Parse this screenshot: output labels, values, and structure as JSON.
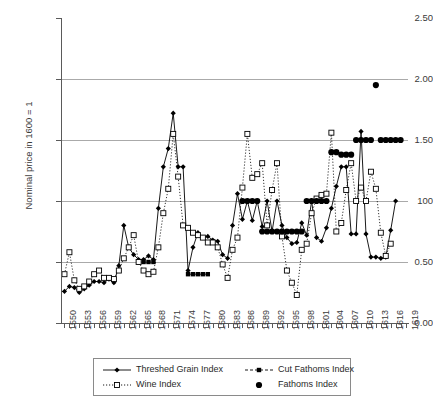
{
  "chart_data": {
    "type": "line",
    "title": "",
    "xlabel": "",
    "ylabel": "Nominal price in 1600 = 1",
    "ylim": [
      0.0,
      2.5
    ],
    "ytick_labels": [
      "0.00",
      "0.50",
      "100",
      "1.50",
      "2.00",
      "2.50"
    ],
    "ytick_values": [
      0.0,
      0.5,
      1.0,
      1.5,
      2.0,
      2.5
    ],
    "grid": "horizontal",
    "legend_position": "bottom",
    "x_start": 1550,
    "x_end": 1619,
    "xtick_labels": [
      "1550",
      "1553",
      "1556",
      "1559",
      "1562",
      "1565",
      "1568",
      "1571",
      "1574",
      "1577",
      "1580",
      "1583",
      "1586",
      "1589",
      "1592",
      "1595",
      "1598",
      "1601",
      "1604",
      "1607",
      "1610",
      "1613",
      "1616",
      "1619"
    ],
    "x": [
      1550,
      1551,
      1552,
      1553,
      1554,
      1555,
      1556,
      1557,
      1558,
      1559,
      1560,
      1561,
      1562,
      1563,
      1564,
      1565,
      1566,
      1567,
      1568,
      1569,
      1570,
      1571,
      1572,
      1573,
      1574,
      1575,
      1576,
      1577,
      1578,
      1579,
      1580,
      1581,
      1582,
      1583,
      1584,
      1585,
      1586,
      1587,
      1588,
      1589,
      1590,
      1591,
      1592,
      1593,
      1594,
      1595,
      1596,
      1597,
      1598,
      1599,
      1600,
      1601,
      1602,
      1603,
      1604,
      1605,
      1606,
      1607,
      1608,
      1609,
      1610,
      1611,
      1612,
      1613,
      1614,
      1615,
      1616,
      1617,
      1618,
      1619
    ],
    "series": [
      {
        "name": "Threshed Grain Index",
        "marker": "filled-diamond",
        "line": "solid",
        "color": "#000000",
        "values": [
          0.26,
          0.3,
          0.29,
          0.25,
          0.28,
          0.31,
          0.34,
          0.34,
          0.33,
          0.36,
          0.33,
          0.47,
          0.8,
          0.62,
          0.56,
          0.52,
          0.52,
          0.55,
          0.52,
          0.94,
          1.28,
          1.43,
          1.72,
          1.28,
          1.28,
          0.43,
          0.62,
          0.74,
          0.7,
          0.71,
          0.68,
          0.67,
          0.56,
          0.53,
          0.8,
          1.06,
          0.85,
          1.0,
          0.84,
          1.0,
          0.79,
          1.0,
          0.75,
          1.0,
          0.8,
          0.7,
          0.65,
          0.66,
          0.82,
          0.72,
          1.0,
          0.7,
          0.67,
          0.78,
          0.94,
          1.12,
          1.28,
          1.28,
          0.73,
          0.73,
          1.57,
          0.73,
          0.54,
          0.54,
          0.53,
          0.54,
          0.76,
          1.0,
          null,
          null
        ]
      },
      {
        "name": "Cut Fathoms Index",
        "marker": "filled-square",
        "line": "dashed",
        "color": "#000000",
        "values": [
          null,
          null,
          null,
          null,
          null,
          null,
          null,
          null,
          null,
          null,
          null,
          null,
          null,
          null,
          null,
          0.5,
          0.5,
          0.5,
          0.5,
          null,
          null,
          null,
          null,
          null,
          null,
          0.4,
          0.4,
          0.4,
          0.4,
          0.4,
          null,
          null,
          null,
          null,
          null,
          null,
          null,
          null,
          null,
          null,
          null,
          null,
          null,
          null,
          null,
          null,
          null,
          null,
          null,
          null,
          null,
          null,
          null,
          null,
          null,
          null,
          null,
          null,
          null,
          null,
          null,
          null,
          null,
          null,
          null,
          null,
          null,
          null,
          null,
          null
        ]
      },
      {
        "name": "Wine Index",
        "marker": "open-square",
        "line": "dotted",
        "color": "#000000",
        "values": [
          0.4,
          0.58,
          0.35,
          0.28,
          0.3,
          0.34,
          0.4,
          0.43,
          0.37,
          0.37,
          0.36,
          0.43,
          0.53,
          0.62,
          0.72,
          0.5,
          0.43,
          0.4,
          0.42,
          0.62,
          0.9,
          1.1,
          1.55,
          1.2,
          0.8,
          0.78,
          0.74,
          0.72,
          0.7,
          0.66,
          0.66,
          0.62,
          0.48,
          0.37,
          0.6,
          0.7,
          1.11,
          1.55,
          1.19,
          1.22,
          1.31,
          0.8,
          1.09,
          1.31,
          0.71,
          0.43,
          0.33,
          0.23,
          0.6,
          0.65,
          0.9,
          1.02,
          1.05,
          1.06,
          1.56,
          0.75,
          0.82,
          1.09,
          1.31,
          1.0,
          1.11,
          1.0,
          1.24,
          1.1,
          0.74,
          0.55,
          0.65,
          null,
          null,
          null
        ]
      },
      {
        "name": "Fathoms Index",
        "marker": "filled-circle",
        "line": "none",
        "color": "#000000",
        "values": [
          null,
          null,
          null,
          null,
          null,
          null,
          null,
          null,
          null,
          null,
          null,
          null,
          null,
          null,
          null,
          null,
          null,
          null,
          null,
          null,
          null,
          null,
          null,
          null,
          null,
          null,
          null,
          null,
          null,
          null,
          null,
          null,
          null,
          null,
          null,
          null,
          1.0,
          1.0,
          1.0,
          1.0,
          0.75,
          0.75,
          0.75,
          0.75,
          0.75,
          0.75,
          0.75,
          0.75,
          0.75,
          1.0,
          1.0,
          1.0,
          1.0,
          1.0,
          1.4,
          1.4,
          1.38,
          1.38,
          1.38,
          1.5,
          1.5,
          1.5,
          1.5,
          1.95,
          1.5,
          1.5,
          1.5,
          1.5,
          1.5,
          null
        ]
      }
    ],
    "legend": [
      {
        "label": "Threshed Grain Index",
        "marker": "filled-diamond",
        "line": "solid"
      },
      {
        "label": "Cut Fathoms Index",
        "marker": "filled-square",
        "line": "dashed"
      },
      {
        "label": "Wine Index",
        "marker": "open-square",
        "line": "dotted"
      },
      {
        "label": "Fathoms Index",
        "marker": "filled-circle",
        "line": "none"
      }
    ]
  },
  "title_fragment": "",
  "axis": {
    "y_title": "Nominal price in 1600 = 1"
  }
}
